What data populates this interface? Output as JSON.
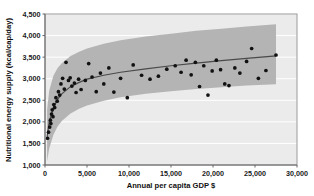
{
  "chart_data": {
    "type": "scatter",
    "title": "",
    "xlabel": "Annual per capita GDP $",
    "ylabel": "Nutritional energy supply (kcal/cap/day)",
    "xlim": [
      0,
      30000
    ],
    "ylim": [
      1000,
      4500
    ],
    "xticks": [
      0,
      5000,
      10000,
      15000,
      20000,
      25000,
      30000
    ],
    "xticklabels": [
      "0",
      "5,000",
      "10,000",
      "15,000",
      "20,000",
      "25,000",
      "30,000"
    ],
    "yticks": [
      1000,
      1500,
      2000,
      2500,
      3000,
      3500,
      4000,
      4500
    ],
    "yticklabels": [
      "1,000",
      "1,500",
      "2,000",
      "2,500",
      "3,000",
      "3,500",
      "4,000",
      "4,500"
    ],
    "grid": "horizontal-white-on-gray",
    "legend": "none",
    "plot_background_color": "#ebebeb",
    "band_color": "#b4b4b4",
    "line_color": "#4a4a4a",
    "point_color": "#111111",
    "series": [
      {
        "name": "Countries",
        "type": "scatter",
        "points": [
          [
            300,
            1620
          ],
          [
            420,
            1760
          ],
          [
            560,
            1880
          ],
          [
            640,
            2040
          ],
          [
            700,
            1960
          ],
          [
            780,
            2180
          ],
          [
            860,
            2280
          ],
          [
            950,
            2120
          ],
          [
            1050,
            2400
          ],
          [
            1150,
            2330
          ],
          [
            1300,
            2560
          ],
          [
            1450,
            2480
          ],
          [
            1600,
            2700
          ],
          [
            1750,
            2620
          ],
          [
            1900,
            2880
          ],
          [
            2100,
            3010
          ],
          [
            2300,
            2760
          ],
          [
            2500,
            3380
          ],
          [
            2800,
            2960
          ],
          [
            3000,
            3020
          ],
          [
            3200,
            2830
          ],
          [
            3500,
            2900
          ],
          [
            3700,
            2680
          ],
          [
            4000,
            2990
          ],
          [
            4300,
            2750
          ],
          [
            4800,
            2960
          ],
          [
            5200,
            3350
          ],
          [
            5600,
            3040
          ],
          [
            6100,
            2700
          ],
          [
            6600,
            3130
          ],
          [
            7000,
            2880
          ],
          [
            7600,
            3250
          ],
          [
            8200,
            2690
          ],
          [
            9000,
            3010
          ],
          [
            9800,
            2560
          ],
          [
            10500,
            3320
          ],
          [
            11500,
            3080
          ],
          [
            12500,
            2990
          ],
          [
            13500,
            3060
          ],
          [
            14500,
            3220
          ],
          [
            15500,
            3300
          ],
          [
            16200,
            3150
          ],
          [
            16800,
            3430
          ],
          [
            17400,
            3090
          ],
          [
            17900,
            3380
          ],
          [
            18400,
            2820
          ],
          [
            18900,
            3300
          ],
          [
            19400,
            2620
          ],
          [
            19900,
            3180
          ],
          [
            20400,
            3430
          ],
          [
            20900,
            3210
          ],
          [
            21400,
            2880
          ],
          [
            21900,
            2840
          ],
          [
            22600,
            3250
          ],
          [
            23200,
            3130
          ],
          [
            24000,
            3400
          ],
          [
            24600,
            3700
          ],
          [
            25400,
            3010
          ],
          [
            26300,
            3190
          ],
          [
            27500,
            3550
          ]
        ]
      }
    ],
    "fit_curve": {
      "name": "Logarithmic fit",
      "description": "Rising saturating trend line through the point cloud",
      "points": [
        [
          250,
          1650
        ],
        [
          500,
          2000
        ],
        [
          1000,
          2330
        ],
        [
          1500,
          2520
        ],
        [
          2000,
          2650
        ],
        [
          3000,
          2810
        ],
        [
          4000,
          2910
        ],
        [
          5000,
          2990
        ],
        [
          7000,
          3080
        ],
        [
          9000,
          3150
        ],
        [
          12000,
          3230
        ],
        [
          15000,
          3300
        ],
        [
          18000,
          3360
        ],
        [
          21000,
          3420
        ],
        [
          24000,
          3470
        ],
        [
          27500,
          3530
        ]
      ]
    },
    "confidence_band": {
      "name": "Confidence interval",
      "upper": [
        [
          250,
          2280
        ],
        [
          500,
          2720
        ],
        [
          1000,
          3070
        ],
        [
          1500,
          3250
        ],
        [
          2000,
          3360
        ],
        [
          3000,
          3520
        ],
        [
          4000,
          3620
        ],
        [
          5000,
          3700
        ],
        [
          7000,
          3810
        ],
        [
          9000,
          3890
        ],
        [
          12000,
          3980
        ],
        [
          15000,
          4040
        ],
        [
          18000,
          4110
        ],
        [
          21000,
          4160
        ],
        [
          24000,
          4210
        ],
        [
          27500,
          4260
        ]
      ],
      "lower": [
        [
          250,
          1080
        ],
        [
          500,
          1380
        ],
        [
          1000,
          1700
        ],
        [
          1500,
          1890
        ],
        [
          2000,
          2020
        ],
        [
          3000,
          2190
        ],
        [
          4000,
          2300
        ],
        [
          5000,
          2380
        ],
        [
          7000,
          2490
        ],
        [
          9000,
          2570
        ],
        [
          12000,
          2650
        ],
        [
          15000,
          2710
        ],
        [
          18000,
          2760
        ],
        [
          21000,
          2800
        ],
        [
          24000,
          2840
        ],
        [
          27500,
          2870
        ]
      ]
    }
  }
}
